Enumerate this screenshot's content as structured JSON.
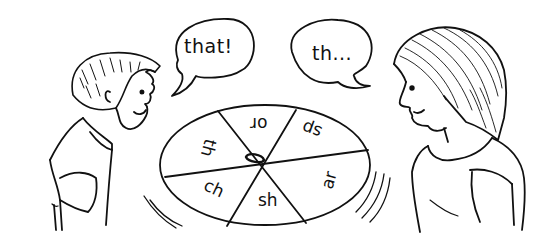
{
  "scene": {
    "description": "Two children play a phonics spinner game",
    "colors": {
      "ink": "#111111",
      "paper": "#ffffff"
    }
  },
  "boy": {
    "speech": "that!"
  },
  "girl": {
    "speech": "th..."
  },
  "spinner": {
    "segments": [
      {
        "label": "or",
        "rotation": 180
      },
      {
        "label": "sp",
        "rotation": 200
      },
      {
        "label": "ar",
        "rotation": -75
      },
      {
        "label": "sh",
        "rotation": 0
      },
      {
        "label": "ch",
        "rotation": 25
      },
      {
        "label": "th",
        "rotation": 105
      }
    ]
  }
}
